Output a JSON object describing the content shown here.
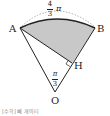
{
  "diagram": {
    "points": {
      "A": "A",
      "B": "B",
      "H": "H",
      "O": "O"
    },
    "arc_label": {
      "numerator": "4",
      "denominator": "3",
      "symbol": "π"
    },
    "angle_label": {
      "numerator": "π",
      "denominator": "3"
    },
    "caption": "[수학] 빼 개이티"
  },
  "colors": {
    "shade": "#c8c8c8",
    "stroke": "#222222",
    "dashed": "#999999"
  }
}
